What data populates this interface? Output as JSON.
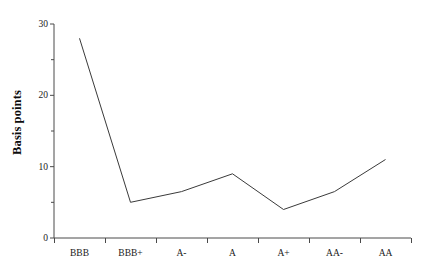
{
  "chart_data": {
    "type": "line",
    "title": "",
    "subtitle": "",
    "xlabel": "",
    "ylabel": "Basis points",
    "categories": [
      "BBB",
      "BBB+",
      "A-",
      "A",
      "A+",
      "AA-",
      "AA"
    ],
    "values": [
      28,
      5,
      6.5,
      9,
      4,
      6.5,
      11
    ],
    "series": [
      {
        "name": "",
        "values": [
          28,
          5,
          6.5,
          9,
          4,
          6.5,
          11
        ]
      }
    ],
    "ylim": [
      0,
      30
    ],
    "y_ticks_major": [
      0,
      10,
      20,
      30
    ],
    "y_ticks_minor": [
      5,
      15,
      25
    ],
    "y_tick_labels": [
      "0",
      "10",
      "20",
      "30"
    ],
    "grid": false,
    "legend": false,
    "legend_position": "none",
    "line_color": "#3a3a3a",
    "background_color": "#ffffff",
    "axis_color": "#4a4a4a"
  }
}
